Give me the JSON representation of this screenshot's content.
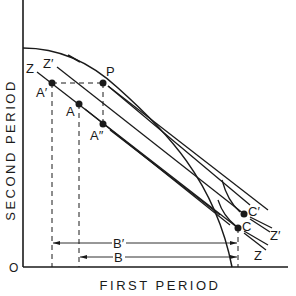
{
  "diagram": {
    "type": "economics-intertemporal-choice",
    "x_axis_label": "FIRST PERIOD",
    "y_axis_label": "SECOND PERIOD",
    "origin_label": "O",
    "colors": {
      "line": "#1a1a1a",
      "background": "#ffffff"
    },
    "curve": {
      "name": "production-possibility-frontier"
    },
    "points": [
      {
        "id": "P",
        "label": "P",
        "x": 103,
        "y": 83
      },
      {
        "id": "A_prime",
        "label": "A′",
        "x": 52,
        "y": 83
      },
      {
        "id": "A",
        "label": "A",
        "x": 79,
        "y": 104
      },
      {
        "id": "A_double_prime",
        "label": "A″",
        "x": 103,
        "y": 124
      },
      {
        "id": "C_prime",
        "label": "C′",
        "x": 244,
        "y": 214
      },
      {
        "id": "C",
        "label": "C",
        "x": 238,
        "y": 228
      }
    ],
    "lines": [
      {
        "id": "Z",
        "label_left": "Z",
        "label_right": "Z"
      },
      {
        "id": "Z_prime",
        "label_left": "Z′",
        "label_right": "Z′"
      }
    ],
    "measures": [
      {
        "id": "B_prime",
        "label": "B′"
      },
      {
        "id": "B",
        "label": "B"
      }
    ]
  }
}
